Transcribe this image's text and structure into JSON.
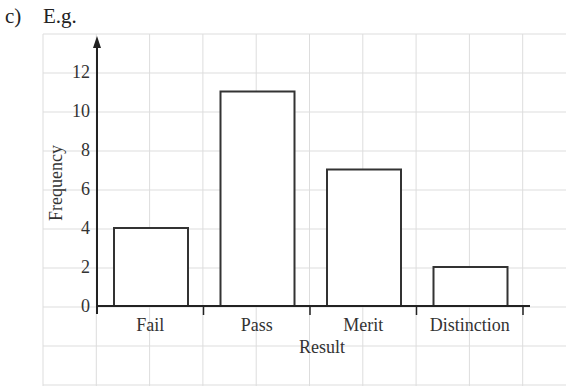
{
  "header": {
    "part_label": "c)",
    "caption": "E.g."
  },
  "chart_data": {
    "type": "bar",
    "title": "",
    "xlabel": "Result",
    "ylabel": "Frequency",
    "categories": [
      "Fail",
      "Pass",
      "Merit",
      "Distinction"
    ],
    "values": [
      4,
      11,
      7,
      2
    ],
    "ylim": [
      0,
      13
    ],
    "yticks": [
      0,
      2,
      4,
      6,
      8,
      10,
      12
    ],
    "grid": true,
    "legend": null
  },
  "colors": {
    "bar_fill": "#ffffff",
    "bar_stroke": "#333333",
    "grid": "#dddddd",
    "axis": "#222222"
  }
}
